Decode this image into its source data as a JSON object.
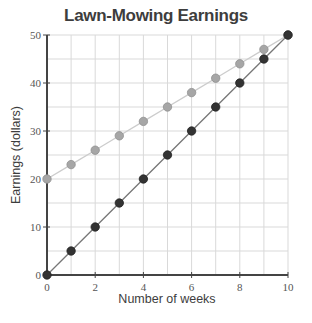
{
  "chart_data": {
    "type": "line",
    "title": "Lawn-Mowing Earnings",
    "xlabel": "Number of weeks",
    "ylabel": "Earnings (dollars)",
    "x": [
      0,
      1,
      2,
      3,
      4,
      5,
      6,
      7,
      8,
      9,
      10
    ],
    "xlim": [
      0,
      10
    ],
    "ylim": [
      0,
      50
    ],
    "xticks": [
      0,
      2,
      4,
      6,
      8,
      10
    ],
    "yticks": [
      0,
      10,
      20,
      30,
      40,
      50
    ],
    "grid": true,
    "legend": null,
    "series": [
      {
        "name": "Starting at $20",
        "color": "#a6a6a6",
        "line_color": "#cccccc",
        "values": [
          20,
          23,
          26,
          29,
          32,
          35,
          38,
          41,
          44,
          47,
          50
        ]
      },
      {
        "name": "Starting at $0",
        "color": "#333333",
        "line_color": "#777777",
        "values": [
          0,
          5,
          10,
          15,
          20,
          25,
          30,
          35,
          40,
          45,
          50
        ]
      }
    ]
  },
  "colors": {
    "grid": "#d9d9d9",
    "axis": "#444444"
  }
}
